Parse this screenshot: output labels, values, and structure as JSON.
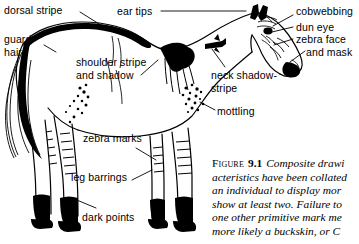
{
  "figure": {
    "type": "line-drawing-illustration",
    "background_color": "#ffffff",
    "ink_color": "#000000"
  },
  "labels": [
    {
      "id": "dorsal-stripe",
      "text": "dorsal stripe"
    },
    {
      "id": "guard-hairs",
      "line1": "guard",
      "line2": "hairs"
    },
    {
      "id": "shoulder-stripe",
      "line1": "shoulder stripe",
      "line2": "and shadow"
    },
    {
      "id": "zebra-marks",
      "text": "zebra marks"
    },
    {
      "id": "leg-barrings",
      "text": "leg barrings"
    },
    {
      "id": "dark-points",
      "text": "dark points"
    },
    {
      "id": "ear-tips",
      "text": "ear tips"
    },
    {
      "id": "cobwebbing",
      "text": "cobwebbing"
    },
    {
      "id": "dun-eye",
      "text": "dun eye"
    },
    {
      "id": "zebra-face-and-mask",
      "line1": "zebra face",
      "line2": "and mask"
    },
    {
      "id": "neck-shadow-stripe",
      "line1": "neck shadow-",
      "line2": "stripe"
    },
    {
      "id": "mottling",
      "text": "mottling"
    }
  ],
  "caption": {
    "figure_word": "Figure",
    "figure_number": "9.1",
    "lines": [
      "Composite drawi",
      "acteristics have been collated",
      "an individual to display mor",
      "show at least two. Failure to",
      "one other primitive mark me",
      "more likely a buckskin, or C"
    ]
  }
}
